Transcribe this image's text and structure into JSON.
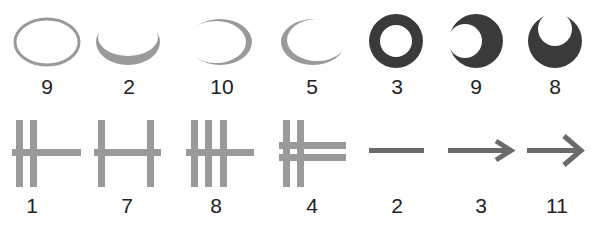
{
  "figure": {
    "colors": {
      "light_gray": "#9a9a9a",
      "dark_gray": "#3a3a3a",
      "mid_gray": "#6a6a6a",
      "background": "#ffffff"
    },
    "rows": [
      {
        "name": "ellipse-row",
        "items": [
          {
            "shape": "ellipse-outline-uniform",
            "label": "9"
          },
          {
            "shape": "ellipse-outline-thick-bottom",
            "label": "2"
          },
          {
            "shape": "ellipse-outline-thick-right",
            "label": "10"
          },
          {
            "shape": "ellipse-outline-thick-left",
            "label": "5"
          },
          {
            "shape": "ring-centered-hole",
            "label": "3"
          },
          {
            "shape": "disk-hole-left",
            "label": "9"
          },
          {
            "shape": "disk-hole-top",
            "label": "8"
          }
        ]
      },
      {
        "name": "line-row",
        "items": [
          {
            "shape": "two-verticals-left-horizontal",
            "label": "1"
          },
          {
            "shape": "two-verticals-spread-horizontal",
            "label": "7"
          },
          {
            "shape": "three-verticals-horizontal",
            "label": "8"
          },
          {
            "shape": "two-verticals-double-horizontal",
            "label": "4"
          },
          {
            "shape": "horizontal-line",
            "label": "2"
          },
          {
            "shape": "arrow-small-head",
            "label": "3"
          },
          {
            "shape": "arrow-large-head",
            "label": "11"
          }
        ]
      }
    ]
  }
}
